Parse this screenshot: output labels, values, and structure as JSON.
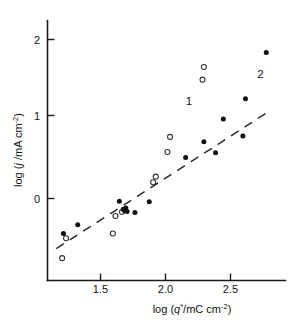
{
  "chart_data": {
    "type": "scatter",
    "title": "",
    "xlabel": "log (q*/mC cm-2)",
    "ylabel": "log (j /mA cm-2)",
    "xlabel_parts": {
      "pre": "log (",
      "var": "q",
      "star": "*",
      "mid": "/mC cm",
      "exp": "-2",
      "post": ")"
    },
    "ylabel_parts": {
      "pre": "log (",
      "var": "j",
      "mid": " /mA cm",
      "exp": "-2",
      "post": ")"
    },
    "xlim": [
      1.12,
      2.84
    ],
    "ylim": [
      -0.85,
      2.28
    ],
    "xticks": [
      1.5,
      2.0,
      2.5
    ],
    "xticklabels": [
      "1.5",
      "2.0",
      "2.5"
    ],
    "yticks": [
      0,
      1,
      2
    ],
    "yticklabels": [
      "0",
      "1",
      "2"
    ],
    "grid": false,
    "legend": "none",
    "annotations": [
      {
        "text": "1",
        "x": 2.18,
        "y": 1.18
      },
      {
        "text": "2",
        "x": 2.73,
        "y": 1.52
      }
    ],
    "trendline": {
      "style": "dashed",
      "x": [
        1.16,
        2.8
      ],
      "y": [
        -0.63,
        1.1
      ],
      "comment": "dashed reference line of unit-like slope"
    },
    "series": [
      {
        "name": "1",
        "marker": "open-circle",
        "points": [
          {
            "x": 1.205,
            "y": -0.75
          },
          {
            "x": 1.235,
            "y": -0.5
          },
          {
            "x": 1.595,
            "y": -0.44
          },
          {
            "x": 1.615,
            "y": -0.22
          },
          {
            "x": 1.665,
            "y": -0.17
          },
          {
            "x": 1.905,
            "y": 0.205
          },
          {
            "x": 1.925,
            "y": 0.275
          },
          {
            "x": 2.015,
            "y": 0.585
          },
          {
            "x": 2.035,
            "y": 0.775
          },
          {
            "x": 2.285,
            "y": 1.495
          },
          {
            "x": 2.295,
            "y": 1.655
          }
        ]
      },
      {
        "name": "2",
        "marker": "filled-circle",
        "points": [
          {
            "x": 1.215,
            "y": -0.44
          },
          {
            "x": 1.325,
            "y": -0.33
          },
          {
            "x": 1.645,
            "y": -0.035
          },
          {
            "x": 1.675,
            "y": -0.135
          },
          {
            "x": 1.685,
            "y": -0.155
          },
          {
            "x": 1.695,
            "y": -0.12
          },
          {
            "x": 1.705,
            "y": -0.165
          },
          {
            "x": 1.765,
            "y": -0.175
          },
          {
            "x": 1.875,
            "y": -0.04
          },
          {
            "x": 2.155,
            "y": 0.515
          },
          {
            "x": 2.295,
            "y": 0.715
          },
          {
            "x": 2.385,
            "y": 0.575
          },
          {
            "x": 2.445,
            "y": 1.0
          },
          {
            "x": 2.595,
            "y": 0.785
          },
          {
            "x": 2.615,
            "y": 1.255
          },
          {
            "x": 2.775,
            "y": 1.835
          }
        ]
      }
    ]
  }
}
